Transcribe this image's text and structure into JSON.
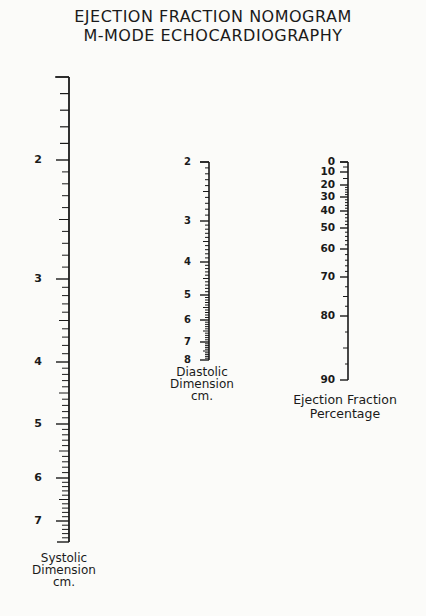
{
  "title": {
    "line1": "EJECTION FRACTION NOMOGRAM",
    "line2": "M-MODE ECHOCARDIOGRAPHY"
  },
  "axes": {
    "systolic": {
      "label_line1": "Systolic",
      "label_line2": "Dimension",
      "label_line3": "cm.",
      "line_x": 69,
      "y_top": 77,
      "y_bottom": 542,
      "major": [
        {
          "label": "2",
          "y": 160
        },
        {
          "label": "3",
          "y": 279
        },
        {
          "label": "4",
          "y": 362
        },
        {
          "label": "5",
          "y": 424
        },
        {
          "label": "6",
          "y": 478
        },
        {
          "label": "7",
          "y": 521
        }
      ]
    },
    "diastolic": {
      "label_line1": "Diastolic",
      "label_line2": "Dimension",
      "label_line3": "cm.",
      "line_x": 209,
      "y_top": 162,
      "y_bottom": 360,
      "major": [
        {
          "label": "2",
          "y": 162
        },
        {
          "label": "3",
          "y": 221
        },
        {
          "label": "4",
          "y": 262
        },
        {
          "label": "5",
          "y": 295
        },
        {
          "label": "6",
          "y": 320
        },
        {
          "label": "7",
          "y": 342
        },
        {
          "label": "8",
          "y": 360
        }
      ]
    },
    "ejection_fraction": {
      "label_line1": "Ejection Fraction",
      "label_line2": "Percentage",
      "line_x": 348,
      "y_top": 162,
      "y_bottom": 380,
      "major": [
        {
          "label": "0",
          "y": 162
        },
        {
          "label": "10",
          "y": 172
        },
        {
          "label": "20",
          "y": 185
        },
        {
          "label": "30",
          "y": 197
        },
        {
          "label": "40",
          "y": 211
        },
        {
          "label": "50",
          "y": 228
        },
        {
          "label": "60",
          "y": 249
        },
        {
          "label": "70",
          "y": 277
        },
        {
          "label": "80",
          "y": 316
        },
        {
          "label": "90",
          "y": 380
        }
      ]
    }
  },
  "colors": {
    "ink": "#1a1a1a",
    "paper": "#fbfbf9"
  }
}
